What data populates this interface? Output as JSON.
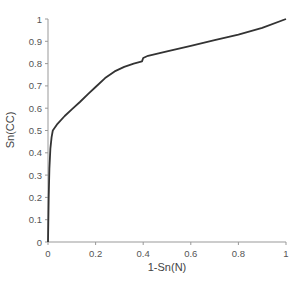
{
  "chart_data": {
    "type": "line",
    "title": "",
    "xlabel": "1-Sn(N)",
    "ylabel": "Sn(CC)",
    "xlim": [
      0,
      1
    ],
    "ylim": [
      0,
      1
    ],
    "grid": false,
    "legend": null,
    "x_ticks": [
      "0",
      "0.2",
      "0.4",
      "0.6",
      "0.8",
      "1"
    ],
    "y_ticks": [
      "0",
      "0.1",
      "0.2",
      "0.3",
      "0.4",
      "0.5",
      "0.6",
      "0.7",
      "0.8",
      "0.9",
      "1"
    ],
    "series": [
      {
        "name": "ROC",
        "color": "#333333",
        "x": [
          0,
          0.003,
          0.006,
          0.01,
          0.015,
          0.02,
          0.04,
          0.07,
          0.1,
          0.134,
          0.17,
          0.2,
          0.24,
          0.28,
          0.32,
          0.36,
          0.395,
          0.4,
          0.42,
          0.5,
          0.6,
          0.7,
          0.8,
          0.9,
          1.0
        ],
        "y": [
          0,
          0.2,
          0.33,
          0.42,
          0.47,
          0.5,
          0.53,
          0.565,
          0.595,
          0.628,
          0.665,
          0.695,
          0.735,
          0.765,
          0.785,
          0.8,
          0.81,
          0.825,
          0.835,
          0.855,
          0.88,
          0.905,
          0.93,
          0.96,
          1.0
        ]
      }
    ]
  }
}
